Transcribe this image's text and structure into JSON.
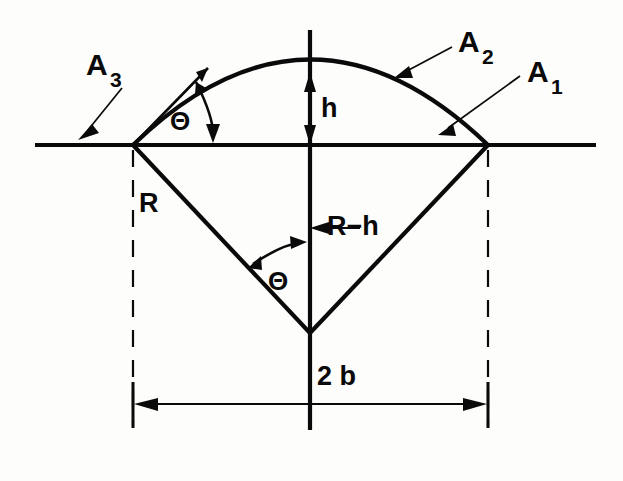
{
  "figure": {
    "background_color": "#fdfdfb",
    "ink_color": "#0a0a0a"
  },
  "labels": {
    "area_1": {
      "base": "A",
      "sub": "1"
    },
    "area_2": {
      "base": "A",
      "sub": "2"
    },
    "area_3": {
      "base": "A",
      "sub": "3"
    },
    "height": "h",
    "radius": "R",
    "apothem": "R−h",
    "chord": "2 b",
    "angle_upper": "Θ",
    "angle_lower": "Θ"
  },
  "geometry": {
    "left_vertex": {
      "x": 133,
      "y": 145
    },
    "right_vertex": {
      "x": 488,
      "y": 145
    },
    "center_vertex": {
      "x": 310,
      "y": 333
    },
    "arc_apex": {
      "x": 310,
      "y": 72
    },
    "baseline": {
      "x1": 35,
      "x2": 596,
      "y": 145
    },
    "vertical_axis": {
      "x": 310,
      "y1": 30,
      "y2": 430
    },
    "dimension_line": {
      "y": 404,
      "x1": 133,
      "x2": 488
    },
    "dashed_left": {
      "x": 133,
      "y1": 150,
      "y2": 428
    },
    "dashed_right": {
      "x": 488,
      "y1": 150,
      "y2": 428
    }
  },
  "notes": {
    "arc_description": "circular arc from left vertex through apex to right vertex",
    "triangle_description": "isosceles triangle: left vertex, right vertex, center below"
  }
}
